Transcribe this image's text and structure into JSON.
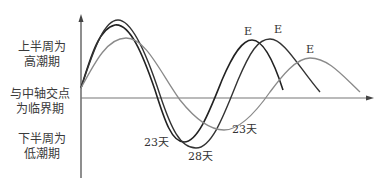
{
  "labels": {
    "upper": [
      "上半周为",
      "高潮期"
    ],
    "middle": [
      "与中轴交点",
      "为临界期"
    ],
    "lower": [
      "下半周为",
      "低潮期"
    ]
  },
  "curves": [
    {
      "name": "23-day cycle",
      "period_label": "23天",
      "peak_label": "E",
      "color": "#222222"
    },
    {
      "name": "28-day cycle",
      "period_label": "28天",
      "peak_label": "E",
      "color": "#333333"
    },
    {
      "name": "33-day cycle",
      "period_label": "23天",
      "peak_label": "E",
      "color": "#888888"
    }
  ],
  "axis": {
    "x_arrow": true,
    "y_arrow": true
  }
}
